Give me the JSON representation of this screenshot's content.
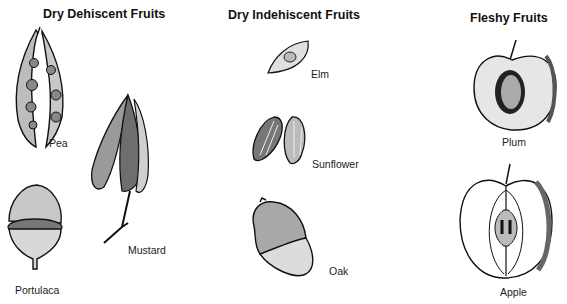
{
  "categories": [
    {
      "heading": "Dry Dehiscent Fruits",
      "fruits": [
        {
          "label": "Pea"
        },
        {
          "label": "Mustard"
        },
        {
          "label": "Portulaca"
        }
      ]
    },
    {
      "heading": "Dry Indehiscent Fruits",
      "fruits": [
        {
          "label": "Elm"
        },
        {
          "label": "Sunflower"
        },
        {
          "label": "Oak"
        }
      ]
    },
    {
      "heading": "Fleshy Fruits",
      "fruits": [
        {
          "label": "Plum"
        },
        {
          "label": "Apple"
        }
      ]
    }
  ]
}
